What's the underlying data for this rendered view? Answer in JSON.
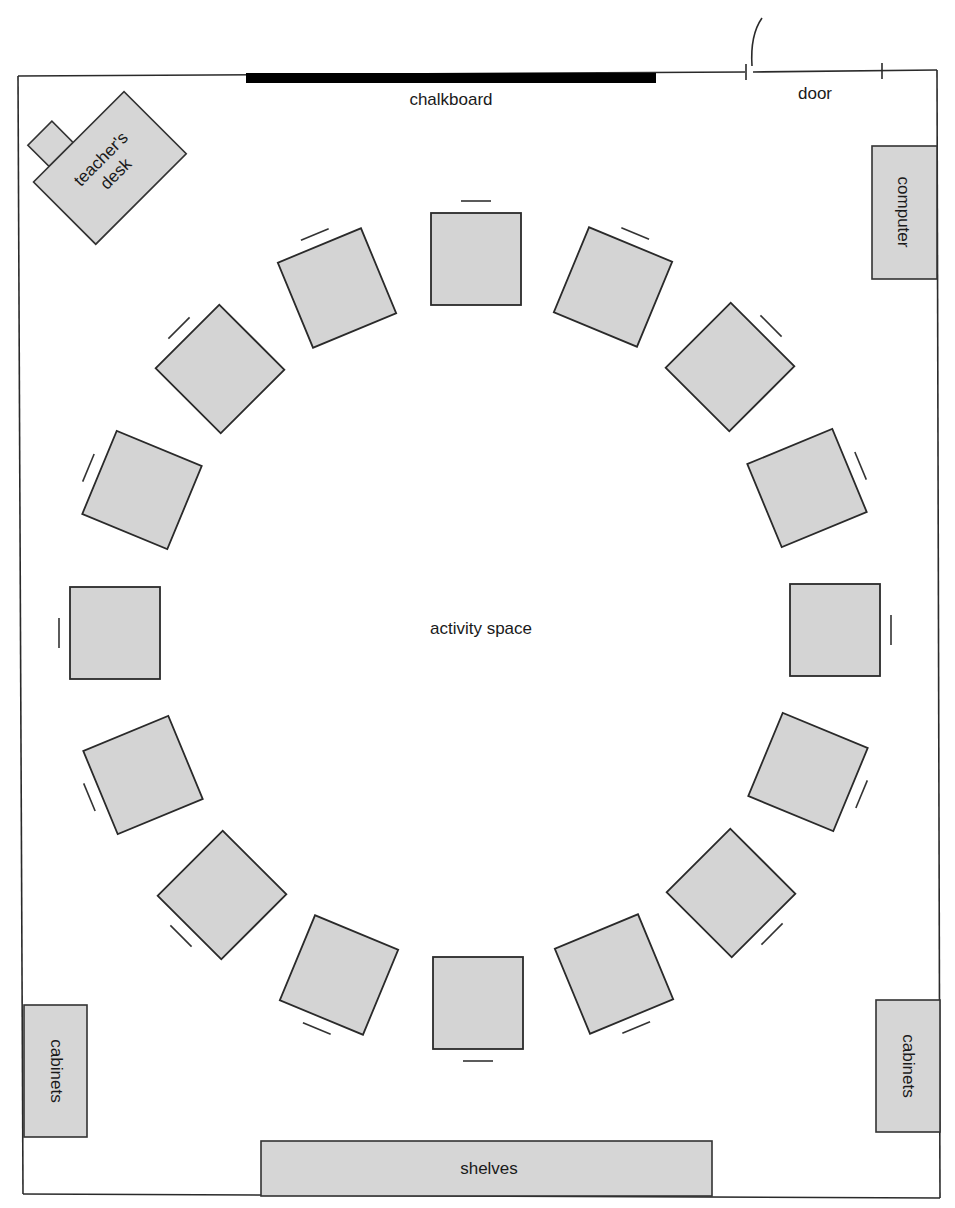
{
  "labels": {
    "chalkboard": "chalkboard",
    "door": "door",
    "teachers_desk_line1": "teacher's",
    "teachers_desk_line2": "desk",
    "computer": "computer",
    "activity_space": "activity space",
    "cabinets_left": "cabinets",
    "cabinets_right": "cabinets",
    "shelves": "shelves"
  },
  "student_desks": {
    "count": 16,
    "arrangement": "circle",
    "center": [
      475,
      632
    ],
    "radius": 365
  },
  "colors": {
    "furniture_fill": "#d4d4d4",
    "outline": "#2a2a2a",
    "chalkboard": "#000000"
  }
}
